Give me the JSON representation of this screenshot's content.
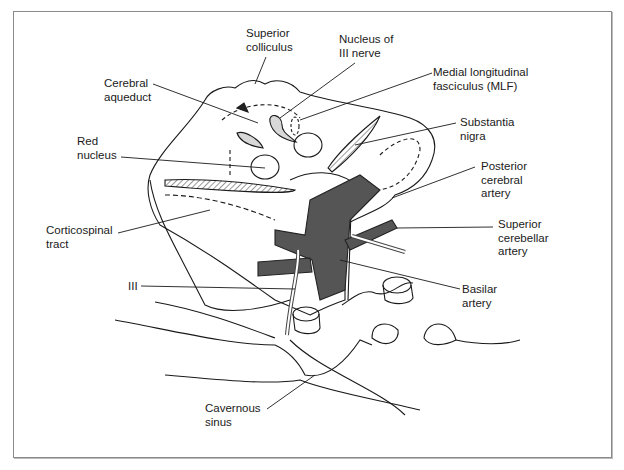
{
  "figure": {
    "colors": {
      "artery": "#555555",
      "line": "#1a1a1a",
      "background": "#ffffff",
      "frame": "#8a8a8a"
    },
    "labels": [
      {
        "id": "superior-colliculus",
        "text": "Superior\ncolliculus"
      },
      {
        "id": "nucleus-of-iii-nerve",
        "text": "Nucleus of\nIII nerve"
      },
      {
        "id": "cerebral-aqueduct",
        "text": "Cerebral\naqueduct"
      },
      {
        "id": "medial-longitudinal-fasciculus",
        "text": "Medial longitudinal\nfasciculus (MLF)"
      },
      {
        "id": "substantia-nigra",
        "text": "Substantia\nnigra"
      },
      {
        "id": "red-nucleus",
        "text": "Red\nnucleus"
      },
      {
        "id": "posterior-cerebral-artery",
        "text": "Posterior\ncerebral\nartery"
      },
      {
        "id": "corticospinal-tract",
        "text": "Corticospinal\ntract"
      },
      {
        "id": "superior-cerebellar-artery",
        "text": "Superior\ncerebellar\nartery"
      },
      {
        "id": "basilar-artery",
        "text": "Basilar\nartery"
      },
      {
        "id": "iii",
        "text": "III"
      },
      {
        "id": "cavernous-sinus",
        "text": "Cavernous\nsinus"
      }
    ]
  }
}
